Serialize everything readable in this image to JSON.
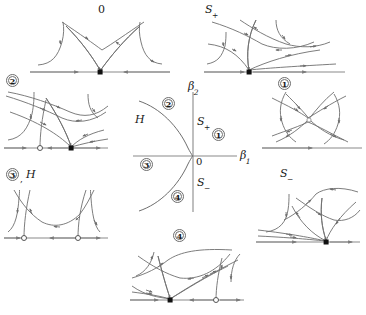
{
  "figure": {
    "colors": {
      "axis": "#8a8a8a",
      "orbit": "#6e6e6e",
      "ink": "#1a1a1a",
      "background": "#ffffff",
      "node_fill": "#111111",
      "saddle_fill": "#ffffff"
    }
  },
  "central_diagram": {
    "name": "parameter-plane",
    "axis_x_label": "β",
    "axis_x_sub": "1",
    "axis_y_label": "β",
    "axis_y_sub": "2",
    "origin_label": "0",
    "curve_label": "H",
    "branch_upper_label": "S",
    "branch_upper_sub": "+",
    "branch_lower_label": "S",
    "branch_lower_sub": "−",
    "regions": [
      {
        "id": "1",
        "label": "1",
        "x": 218,
        "y": 134
      },
      {
        "id": "2",
        "label": "2",
        "x": 168,
        "y": 103
      },
      {
        "id": "3",
        "label": "3",
        "x": 146,
        "y": 164
      },
      {
        "id": "4",
        "label": "4",
        "x": 177,
        "y": 196
      }
    ]
  },
  "panels": [
    {
      "key": "zero",
      "name": "phase-portrait-zero",
      "label": "0",
      "label_style": "plain",
      "position": "top-center",
      "equilibria": [
        {
          "type": "node",
          "marker": "filled"
        }
      ]
    },
    {
      "key": "s_plus",
      "name": "phase-portrait-s-plus",
      "label": "S",
      "sub": "+",
      "label_style": "italic",
      "position": "top-right",
      "equilibria": [
        {
          "type": "node",
          "marker": "filled"
        }
      ]
    },
    {
      "key": "region2",
      "name": "phase-portrait-region-2",
      "label": "2",
      "badge": true,
      "position": "left-upper",
      "equilibria": [
        {
          "type": "saddle",
          "marker": "open"
        },
        {
          "type": "node",
          "marker": "filled"
        }
      ]
    },
    {
      "key": "region1",
      "name": "phase-portrait-region-1",
      "label": "1",
      "badge": true,
      "position": "right-upper",
      "equilibria": []
    },
    {
      "key": "region3",
      "name": "phase-portrait-region-3",
      "label": "3",
      "badge": true,
      "extra_label": "H",
      "separator": ",",
      "position": "left-lower",
      "equilibria": [
        {
          "type": "saddle",
          "marker": "open"
        },
        {
          "type": "saddle",
          "marker": "open"
        }
      ]
    },
    {
      "key": "s_minus",
      "name": "phase-portrait-s-minus",
      "label": "S",
      "sub": "−",
      "label_style": "italic",
      "position": "right-lower",
      "equilibria": [
        {
          "type": "node",
          "marker": "filled"
        }
      ]
    },
    {
      "key": "region4",
      "name": "phase-portrait-region-4",
      "label": "4",
      "badge": true,
      "position": "bottom-center",
      "equilibria": [
        {
          "type": "node",
          "marker": "filled"
        },
        {
          "type": "saddle",
          "marker": "open"
        }
      ]
    }
  ]
}
